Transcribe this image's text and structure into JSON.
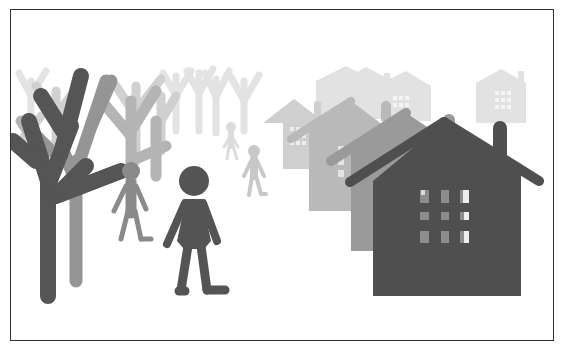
{
  "illustration": {
    "subject": "village scene with bare trees, walking people and houses",
    "colors": {
      "background": "#ffffff",
      "border": "#333333",
      "darkest": "#4a4a4a",
      "dark": "#6b6b6b",
      "mid": "#8f8f8f",
      "light": "#b8b8b8",
      "lighter": "#d4d4d4",
      "faint": "#e6e6e6",
      "window_light": "#f2f2f2",
      "window_mid": "#9a9a9a"
    }
  }
}
